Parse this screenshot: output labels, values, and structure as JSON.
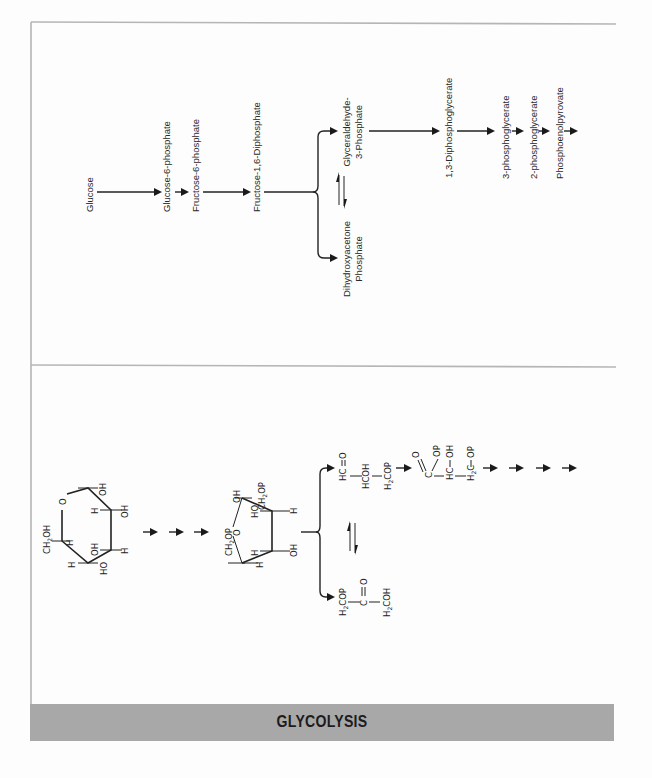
{
  "diagram": {
    "title": "GLYCOLYSIS",
    "type": "metabolic-pathway",
    "pathway_names": {
      "glucose": "Glucose",
      "g6p": "Glucose-6-phosphate",
      "f6p": "Fructose-6-phosphate",
      "f16dp": "Fructose-1,6-Diphosphate",
      "gap_line1": "Glyceraldehyde-",
      "gap_line2": "3-Phosphate",
      "dhap_line1": "Dihydroxyacetone",
      "dhap_line2": "Phosphate",
      "bpg13": "1,3-Diphosphoglycerate",
      "pg3": "3-phosphoglycerate",
      "pg2": "2-phosphoglycerate",
      "pep": "Phosphoenolpyrovate"
    },
    "structures": {
      "glucose_ring": {
        "ch2oh": "CH",
        "ch2oh_sub": "2",
        "ch2oh_tail": "OH",
        "ring_o": "O",
        "h1": "H",
        "h2": "H",
        "h3": "H",
        "h4": "H",
        "h5": "H",
        "oh1": "OH",
        "oh2": "OH",
        "oh3": "OH",
        "ho1": "HO"
      },
      "fructose_ring": {
        "ch2op_left": "CH",
        "ch2op_left_sub": "2",
        "ch2op_left_tail": "OP",
        "ch2op_right": "CH",
        "ch2op_right_sub": "2",
        "ch2op_right_tail": "OP",
        "ring_o": "O",
        "oh_top": "OH",
        "ho_mid": "HO",
        "h_right": "H",
        "h_low1": "H",
        "h_low2": "H",
        "oh_right": "OH"
      },
      "gap": {
        "c1": "HC",
        "o1": "O",
        "c2": "HCOH",
        "c3": "H",
        "c3_sub": "2",
        "c3_tail": "COP"
      },
      "bpg": {
        "o": "O",
        "op1": "OP",
        "c1": "C",
        "c2": "HC",
        "oh": "OH",
        "c3": "H",
        "c3_sub": "2",
        "c3_tail": "C",
        "op2": "OP"
      },
      "dhap": {
        "c1": "H",
        "c1_sub": "2",
        "c1_tail": "COP",
        "c2": "C",
        "o": "O",
        "c3": "H",
        "c3_sub": "2",
        "c3_tail": "COH"
      }
    }
  }
}
